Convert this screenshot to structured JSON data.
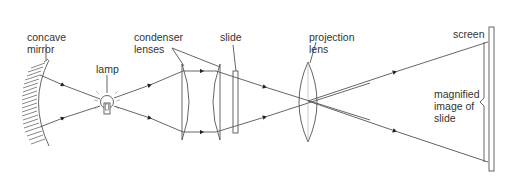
{
  "labels": {
    "concave_mirror": [
      "concave",
      "mirror"
    ],
    "lamp": "lamp",
    "condenser_lenses": [
      "condenser",
      "lenses"
    ],
    "slide": "slide",
    "projection_lens": [
      "projection",
      "lens"
    ],
    "screen": "screen",
    "magnified_image": [
      "magnified",
      "image of",
      "slide"
    ]
  },
  "colors": {
    "line": "#555555",
    "text": "#333333",
    "background": "#ffffff"
  }
}
